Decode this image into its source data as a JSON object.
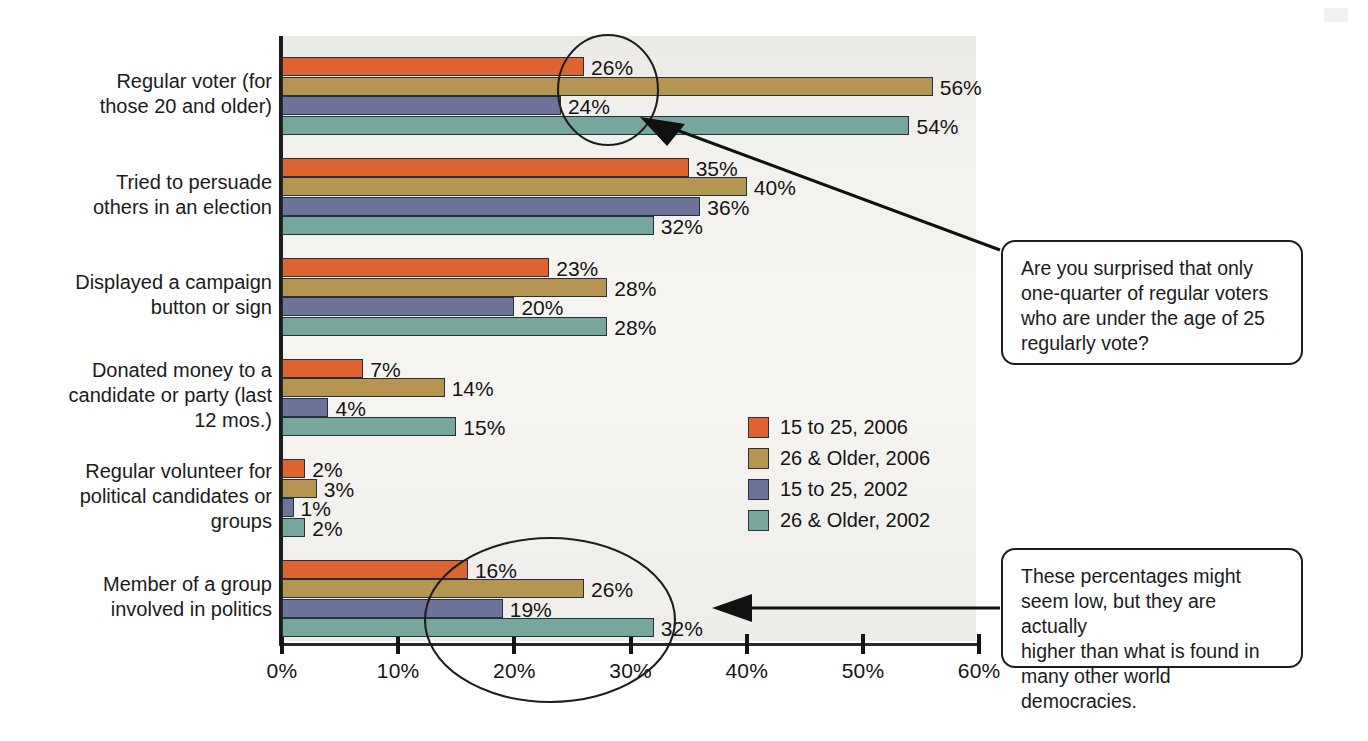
{
  "chart_data": {
    "type": "bar",
    "orientation": "horizontal",
    "title": "",
    "xlabel": "",
    "ylabel": "",
    "xlim": [
      0,
      60
    ],
    "xticks": [
      "0%",
      "10%",
      "20%",
      "30%",
      "40%",
      "50%",
      "60%"
    ],
    "xtick_values": [
      0,
      10,
      20,
      30,
      40,
      50,
      60
    ],
    "grid": false,
    "legend_position": "center-right",
    "categories": [
      "Regular voter (for those 20 and older)",
      "Tried to persuade others in an election",
      "Displayed a campaign button or sign",
      "Donated money to a candidate or party (last 12 mos.)",
      "Regular volunteer for political candidates or groups",
      "Member of a group involved in politics"
    ],
    "category_lines": [
      [
        "Regular voter (for",
        "those 20 and older)"
      ],
      [
        "Tried to persuade",
        "others in an election"
      ],
      [
        "Displayed a campaign",
        "button or sign"
      ],
      [
        "Donated money to a",
        "candidate or party (last",
        "12 mos.)"
      ],
      [
        "Regular volunteer for",
        "political candidates or",
        "groups"
      ],
      [
        "Member of a group",
        "involved in politics"
      ]
    ],
    "series": [
      {
        "name": "15 to 25, 2006",
        "color": "#dd6431",
        "values": [
          26,
          35,
          23,
          7,
          2,
          16
        ],
        "labels": [
          "26%",
          "35%",
          "23%",
          "7%",
          "2%",
          "16%"
        ]
      },
      {
        "name": "26 & Older, 2006",
        "color": "#b69452",
        "values": [
          56,
          40,
          28,
          14,
          3,
          26
        ],
        "labels": [
          "56%",
          "40%",
          "28%",
          "14%",
          "3%",
          "26%"
        ]
      },
      {
        "name": "15 to 25, 2002",
        "color": "#6d7399",
        "values": [
          24,
          36,
          20,
          4,
          1,
          19
        ],
        "labels": [
          "24%",
          "36%",
          "20%",
          "4%",
          "1%",
          "19%"
        ]
      },
      {
        "name": "26 & Older, 2002",
        "color": "#77a69d",
        "values": [
          54,
          32,
          28,
          15,
          2,
          32
        ],
        "labels": [
          "54%",
          "32%",
          "28%",
          "15%",
          "2%",
          "32%"
        ]
      }
    ]
  },
  "legend": {
    "items": [
      {
        "label": "15 to 25, 2006",
        "color": "#dd6431"
      },
      {
        "label": "26 & Older, 2006",
        "color": "#b69452"
      },
      {
        "label": "15 to 25, 2002",
        "color": "#6d7399"
      },
      {
        "label": "26 & Older, 2002",
        "color": "#77a69d"
      }
    ]
  },
  "annotations": {
    "callout_1": {
      "lines": [
        "Are you surprised that only",
        "one-quarter of regular voters",
        "who are under the age of 25",
        "regularly vote?"
      ],
      "highlight_shape": "circle"
    },
    "callout_2": {
      "lines": [
        "These percentages might",
        "seem low, but they are actually",
        "higher than what is found in",
        "many other world democracies."
      ],
      "highlight_shape": "ellipse"
    }
  },
  "colors": {
    "series_2006_youth": "#dd6431",
    "series_2006_older": "#b69452",
    "series_2002_youth": "#6d7399",
    "series_2002_older": "#77a69d",
    "plot_background": "#f3f1ee",
    "axis": "#1c1c1c",
    "text": "#1a1a1a"
  }
}
